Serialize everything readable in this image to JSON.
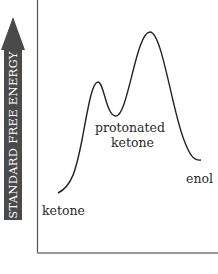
{
  "diagram": {
    "y_axis_label": "STANDARD FREE ENERGY",
    "states": [
      {
        "label": "ketone"
      },
      {
        "label_line1": "protonated",
        "label_line2": "ketone"
      },
      {
        "label": "enol"
      }
    ],
    "colors": {
      "arrow": "#4a4a4a",
      "curve": "#222222",
      "axis": "#555555",
      "text": "#2a2a2a"
    }
  }
}
